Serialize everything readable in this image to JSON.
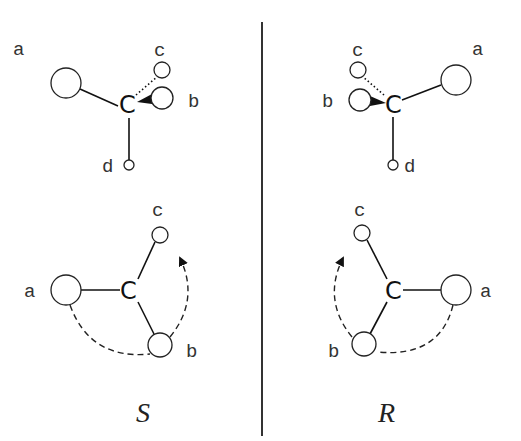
{
  "divider": {
    "x": 262,
    "y1": 22,
    "y2": 436
  },
  "panels": [
    {
      "name": "S",
      "configuration_label": "S",
      "center_atom": "C",
      "projection_3d": {
        "atom_pos": [
          128,
          103
        ],
        "substituents": [
          {
            "label": "a",
            "cx": 66,
            "cy": 83,
            "r": 15,
            "label_x": 13,
            "label_y": 55,
            "bond": "plain"
          },
          {
            "label": "b",
            "cx": 162,
            "cy": 98,
            "r": 11,
            "label_x": 188,
            "label_y": 107,
            "bond": "wedge"
          },
          {
            "label": "c",
            "cx": 162,
            "cy": 70,
            "r": 8,
            "label_x": 154,
            "label_y": 56,
            "bond": "dashed"
          },
          {
            "label": "d",
            "cx": 129,
            "cy": 165,
            "r": 5,
            "label_x": 102,
            "label_y": 172,
            "bond": "plain"
          }
        ]
      },
      "planar_view": {
        "atom_pos": [
          130,
          290
        ],
        "substituents": [
          {
            "label": "a",
            "cx": 66,
            "cy": 290,
            "r": 15,
            "label_x": 24,
            "label_y": 297
          },
          {
            "label": "c",
            "cx": 160,
            "cy": 235,
            "r": 8,
            "label_x": 152,
            "label_y": 216
          },
          {
            "label": "b",
            "cx": 160,
            "cy": 345,
            "r": 12,
            "label_x": 186,
            "label_y": 357
          }
        ],
        "rotation_direction": "counter-clockwise (a→b→c)"
      },
      "label_pos": [
        136,
        415
      ]
    },
    {
      "name": "R",
      "configuration_label": "R",
      "center_atom": "C",
      "projection_3d": {
        "atom_pos": [
          393,
          103
        ],
        "substituents": [
          {
            "label": "a",
            "cx": 456,
            "cy": 80,
            "r": 15,
            "label_x": 472,
            "label_y": 55,
            "bond": "plain"
          },
          {
            "label": "b",
            "cx": 360,
            "cy": 100,
            "r": 11,
            "label_x": 322,
            "label_y": 107,
            "bond": "wedge"
          },
          {
            "label": "c",
            "cx": 358,
            "cy": 70,
            "r": 8,
            "label_x": 352,
            "label_y": 56,
            "bond": "dashed"
          },
          {
            "label": "d",
            "cx": 393,
            "cy": 165,
            "r": 5,
            "label_x": 404,
            "label_y": 172,
            "bond": "plain"
          }
        ]
      },
      "planar_view": {
        "atom_pos": [
          393,
          290
        ],
        "substituents": [
          {
            "label": "a",
            "cx": 456,
            "cy": 290,
            "r": 15,
            "label_x": 480,
            "label_y": 297
          },
          {
            "label": "c",
            "cx": 362,
            "cy": 233,
            "r": 8,
            "label_x": 354,
            "label_y": 216
          },
          {
            "label": "b",
            "cx": 364,
            "cy": 344,
            "r": 12,
            "label_x": 328,
            "label_y": 357
          }
        ],
        "rotation_direction": "clockwise (a→b→c)"
      },
      "label_pos": [
        378,
        415
      ]
    }
  ]
}
